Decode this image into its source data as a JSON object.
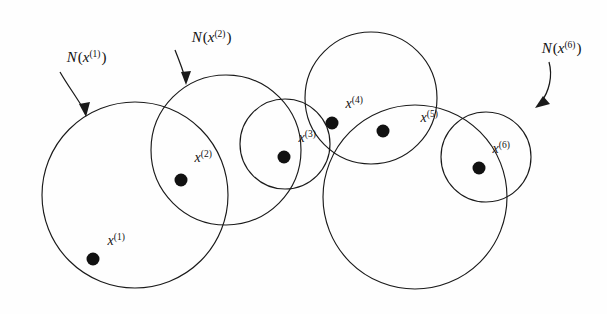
{
  "figure": {
    "background_color": "#fefefe",
    "stroke_color": "#1a1a1a",
    "dot_color": "#111111",
    "width": 607,
    "height": 314
  },
  "neighborhood_labels": [
    {
      "id": "n-x1",
      "base": "N",
      "open_paren": "(",
      "variable": "x",
      "superscript": "(1)",
      "close_paren": ")",
      "full_text": "N(x(1))",
      "label_x": 33,
      "label_y": 62,
      "arrow_from_x": 60,
      "arrow_from_y": 72,
      "arrow_to_x": 86,
      "arrow_to_y": 114
    },
    {
      "id": "n-x2",
      "base": "N",
      "open_paren": "(",
      "variable": "x",
      "superscript": "(2)",
      "close_paren": ")",
      "full_text": "N(x(2))",
      "label_x": 158,
      "label_y": 42,
      "arrow_from_x": 175,
      "arrow_from_y": 50,
      "arrow_to_x": 186,
      "arrow_to_y": 82
    },
    {
      "id": "n-x6",
      "base": "N",
      "open_paren": "(",
      "variable": "x",
      "superscript": "(6)",
      "close_paren": ")",
      "full_text": "N(x(6))",
      "label_x": 508,
      "label_y": 53,
      "arrow_from_x": 545,
      "arrow_from_y": 62,
      "arrow_to_x": 539,
      "arrow_to_y": 106
    }
  ],
  "circles": [
    {
      "id": "circle-1",
      "name": "neighborhood-circle-1",
      "cx": 135,
      "cy": 195,
      "r": 93
    },
    {
      "id": "circle-2",
      "name": "neighborhood-circle-2",
      "cx": 226,
      "cy": 150,
      "r": 75
    },
    {
      "id": "circle-3",
      "name": "neighborhood-circle-3",
      "cx": 285,
      "cy": 144,
      "r": 45
    },
    {
      "id": "circle-4",
      "name": "neighborhood-circle-4",
      "cx": 371,
      "cy": 98,
      "r": 66
    },
    {
      "id": "circle-5",
      "name": "neighborhood-circle-5",
      "cx": 415,
      "cy": 197,
      "r": 92
    },
    {
      "id": "circle-6",
      "name": "neighborhood-circle-6",
      "cx": 486,
      "cy": 157,
      "r": 45
    }
  ],
  "points": [
    {
      "id": "x1",
      "variable": "x",
      "superscript": "(1)",
      "full_text": "x(1)",
      "dot_x": 93,
      "dot_y": 259,
      "dot_r": 6.5,
      "label_x": 76,
      "label_y": 245
    },
    {
      "id": "x2",
      "variable": "x",
      "superscript": "(2)",
      "full_text": "x(2)",
      "dot_x": 181,
      "dot_y": 180,
      "dot_r": 6.5,
      "label_x": 163,
      "label_y": 162
    },
    {
      "id": "x3",
      "variable": "x",
      "superscript": "(3)",
      "full_text": "x(3)",
      "dot_x": 284,
      "dot_y": 157,
      "dot_r": 6.5,
      "label_x": 267,
      "label_y": 142
    },
    {
      "id": "x4",
      "variable": "x",
      "superscript": "(4)",
      "full_text": "x(4)",
      "dot_x": 332,
      "dot_y": 123,
      "dot_r": 6.5,
      "label_x": 314,
      "label_y": 108
    },
    {
      "id": "x5",
      "variable": "x",
      "superscript": "(5)",
      "full_text": "x(5)",
      "dot_x": 383,
      "dot_y": 131,
      "dot_r": 6.5,
      "label_x": 389,
      "label_y": 122
    },
    {
      "id": "x6",
      "variable": "x",
      "superscript": "(6)",
      "full_text": "x(6)",
      "dot_x": 479,
      "dot_y": 168,
      "dot_r": 6.5,
      "label_x": 461,
      "label_y": 153
    }
  ]
}
